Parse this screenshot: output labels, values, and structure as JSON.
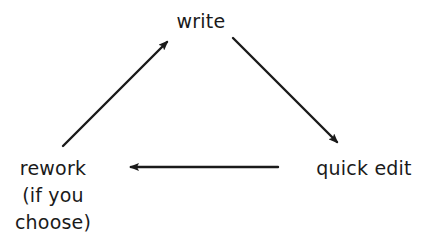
{
  "diagram": {
    "type": "cycle",
    "colors": {
      "background": "#ffffff",
      "stroke": "#1a1a1a",
      "text": "#1a1a1a"
    },
    "nodes": {
      "write": {
        "label": "write"
      },
      "quick_edit": {
        "label": "quick edit"
      },
      "rework": {
        "lines": [
          "rework",
          "(if you",
          "choose)"
        ]
      }
    },
    "edges": [
      {
        "from": "rework",
        "to": "write"
      },
      {
        "from": "write",
        "to": "quick edit"
      },
      {
        "from": "quick edit",
        "to": "rework"
      }
    ]
  }
}
